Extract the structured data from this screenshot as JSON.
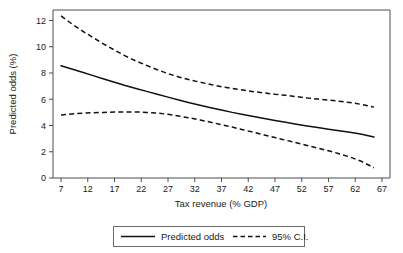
{
  "chart_data": {
    "type": "line",
    "title": "",
    "xlabel": "Tax revenue (% GDP)",
    "ylabel": "Predicted odds (%)",
    "xlim": [
      5.5,
      68.5
    ],
    "ylim": [
      0,
      12.8
    ],
    "xticks": [
      7,
      12,
      17,
      22,
      27,
      32,
      37,
      42,
      47,
      52,
      57,
      62,
      67
    ],
    "yticks": [
      0,
      2,
      4,
      6,
      8,
      10,
      12
    ],
    "xtick_labels": [
      "7",
      "12",
      "17",
      "22",
      "27",
      "32",
      "37",
      "42",
      "47",
      "52",
      "57",
      "62",
      "67"
    ],
    "ytick_labels": [
      "0",
      "2",
      "4",
      "6",
      "8",
      "10",
      "12"
    ],
    "grid": false,
    "legend_position": "below-axes",
    "x": [
      7,
      9,
      11,
      13,
      15,
      17,
      19,
      21,
      23,
      25,
      27,
      29,
      31,
      33,
      35,
      37,
      39,
      41,
      43,
      45,
      47,
      49,
      51,
      53,
      55,
      57,
      59,
      61,
      63,
      65.5
    ],
    "series": [
      {
        "name": "Predicted odds",
        "style": "solid",
        "color": "#111111",
        "values": [
          8.55,
          8.3,
          8.05,
          7.8,
          7.55,
          7.3,
          7.05,
          6.82,
          6.6,
          6.38,
          6.16,
          5.95,
          5.74,
          5.55,
          5.36,
          5.18,
          5.0,
          4.84,
          4.68,
          4.53,
          4.38,
          4.24,
          4.1,
          3.97,
          3.85,
          3.72,
          3.6,
          3.48,
          3.35,
          3.12
        ]
      },
      {
        "name": "95% C.I. upper",
        "style": "dashed",
        "color": "#111111",
        "values": [
          12.35,
          11.75,
          11.2,
          10.7,
          10.2,
          9.75,
          9.3,
          8.92,
          8.58,
          8.25,
          7.95,
          7.7,
          7.48,
          7.3,
          7.12,
          6.95,
          6.82,
          6.7,
          6.58,
          6.48,
          6.38,
          6.3,
          6.2,
          6.1,
          6.02,
          5.93,
          5.85,
          5.75,
          5.62,
          5.4
        ]
      },
      {
        "name": "95% C.I. lower",
        "style": "dashed",
        "color": "#111111",
        "values": [
          4.8,
          4.88,
          4.94,
          4.98,
          5.0,
          5.02,
          5.03,
          5.03,
          5.0,
          4.95,
          4.85,
          4.72,
          4.58,
          4.42,
          4.25,
          4.06,
          3.88,
          3.68,
          3.48,
          3.28,
          3.08,
          2.88,
          2.68,
          2.48,
          2.28,
          2.08,
          1.85,
          1.6,
          1.3,
          0.78
        ]
      }
    ],
    "legend": [
      {
        "label": "Predicted odds",
        "style": "solid"
      },
      {
        "label": "95% C.I.",
        "style": "dashed"
      }
    ]
  }
}
